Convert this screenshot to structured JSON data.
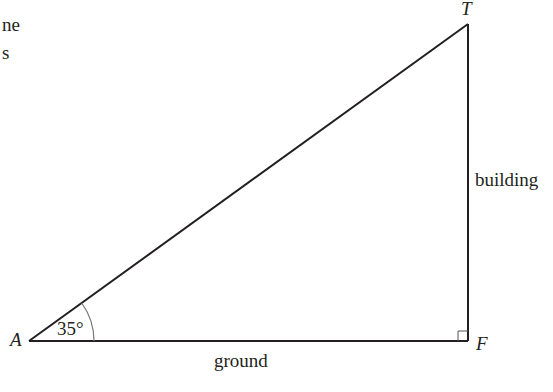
{
  "cropped_text": {
    "line1": "ne",
    "line2": "s"
  },
  "diagram": {
    "type": "right-triangle",
    "vertices": {
      "A": {
        "label": "A",
        "x": 29,
        "y": 341
      },
      "T": {
        "label": "T",
        "x": 468,
        "y": 24
      },
      "F": {
        "label": "F",
        "x": 468,
        "y": 341
      }
    },
    "angle": {
      "vertex": "A",
      "label": "35°",
      "value_deg": 35
    },
    "right_angle": {
      "vertex": "F"
    },
    "sides": {
      "AF": {
        "label": "ground"
      },
      "TF": {
        "label": "building"
      },
      "AT": {
        "label": ""
      }
    },
    "colors": {
      "line": "#231f20",
      "arc": "#777777"
    }
  }
}
